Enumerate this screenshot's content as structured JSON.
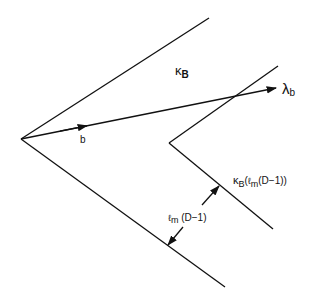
{
  "diagram": {
    "labels": {
      "kappa_main": "κ",
      "kappa_main_sub": "B",
      "lambda": "λ",
      "lambda_sub": "b",
      "b_vector": "b",
      "kappa_shifted": "κ",
      "kappa_shifted_sub": "B",
      "kappa_shifted_arg_open": "(",
      "kappa_shifted_ell": "ℓ",
      "kappa_shifted_ell_sub": "m",
      "kappa_shifted_arg_rest": "(D−1))",
      "distance_ell": "ℓ",
      "distance_ell_sub": "m",
      "distance_rest": " (D−1)"
    },
    "geometry": {
      "outer_cone": {
        "vertex": [
          21,
          139
        ],
        "upper_end": [
          209,
          18
        ],
        "lower_end": [
          225,
          287
        ]
      },
      "inner_cone": {
        "vertex": [
          169,
          143
        ],
        "upper_end": [
          278,
          66
        ],
        "lower_end": [
          273,
          229
        ]
      },
      "ray_b": {
        "start": [
          21,
          139
        ],
        "end": [
          276,
          88
        ]
      },
      "distance_arrows": [
        {
          "from": [
            202,
            205
          ],
          "to": [
            219,
            186
          ]
        },
        {
          "from": [
            183,
            227
          ],
          "to": [
            168,
            245
          ]
        }
      ]
    },
    "colors": {
      "stroke": "#111111",
      "background": "#ffffff"
    }
  }
}
